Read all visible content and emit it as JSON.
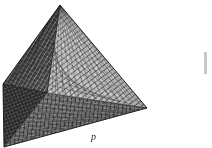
{
  "figure": {
    "kind": "scanned-illustration",
    "caption_label": "p",
    "surface_style": "triangular wireframe mesh",
    "background_color": "#ffffff",
    "ink_color": "#1c1c1c",
    "faces": [
      {
        "name": "left-face",
        "shading": "dark",
        "fill_color": "#4a4a4a"
      },
      {
        "name": "right-face",
        "shading": "light",
        "fill_color": "#b8b8b8"
      },
      {
        "name": "bottom-face",
        "shading": "mid",
        "fill_color": "#7a7a7a"
      },
      {
        "name": "inner-left-face",
        "shading": "darkest",
        "fill_color": "#3a3a3a"
      }
    ],
    "vertices": {
      "apex": {
        "x": 60,
        "y": 5
      },
      "left": {
        "x": 3,
        "y": 84
      },
      "right": {
        "x": 147,
        "y": 108
      },
      "front": {
        "x": 4,
        "y": 147
      },
      "center_hidden": {
        "x": 47,
        "y": 93
      }
    },
    "mesh": {
      "subdivision_rows": 22,
      "line_color": "#2e2e2e",
      "line_width": 0.45
    },
    "edge_artifact": {
      "name": "right-margin-mark",
      "x": 204,
      "y": 52,
      "width": 3,
      "height": 22,
      "color": "#9a9a9a"
    }
  }
}
